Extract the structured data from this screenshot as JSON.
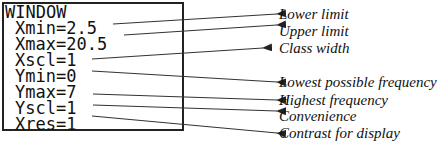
{
  "window_screen": {
    "title": "WINDOW",
    "settings": [
      {
        "text": "Xmin=2.5"
      },
      {
        "text": "Xmax=20.5"
      },
      {
        "text": "Xscl=1"
      },
      {
        "text": "Ymin=0"
      },
      {
        "text": "Ymax=7"
      },
      {
        "text": "Yscl=1"
      },
      {
        "text": "Xres=1"
      }
    ]
  },
  "annotations": [
    {
      "label": "Lower limit",
      "points_to": "Xmin"
    },
    {
      "label": "Upper limit",
      "points_to": "Xmax"
    },
    {
      "label": "Class width",
      "points_to": "Xscl"
    },
    {
      "label": "Lowest possible frequency",
      "points_to": "Ymin"
    },
    {
      "label": "Highest frequency",
      "points_to": "Ymax"
    },
    {
      "label": "Convenience",
      "points_to": "Yscl"
    },
    {
      "label": "Contrast for display",
      "points_to": "Xres"
    }
  ]
}
